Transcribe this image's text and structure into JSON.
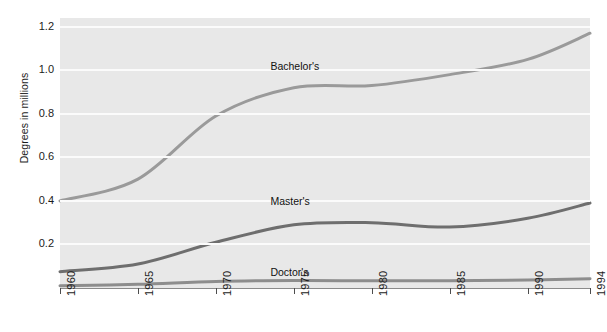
{
  "chart_data": {
    "type": "line",
    "title": "",
    "subtitle": "",
    "xlabel": "",
    "ylabel": "Degrees in millions",
    "x": [
      1960,
      1965,
      1970,
      1975,
      1980,
      1985,
      1990,
      1994
    ],
    "xtick_labels": [
      "1960",
      "1965",
      "1970",
      "1975",
      "1980",
      "1985",
      "1990",
      "1994"
    ],
    "ytick_labels": [
      "0.2",
      "0.4",
      "0.6",
      "0.8",
      "1.0",
      "1.2"
    ],
    "ytick_values": [
      0.2,
      0.4,
      0.6,
      0.8,
      1.0,
      1.2
    ],
    "xlim": [
      1960,
      1994
    ],
    "ylim": [
      0.0,
      1.24
    ],
    "grid": "horizontal-white-gridlines",
    "legend": "inline-labels-on-series",
    "plot_background": "#e8e8e8",
    "figure_background": "#ffffff",
    "series": [
      {
        "name": "Bachelor's",
        "label": "Bachelor's",
        "color": "#9a9a9a",
        "line_width": 3,
        "label_x": 1973.5,
        "label_y": 1.02,
        "values": [
          0.4,
          0.5,
          0.79,
          0.92,
          0.93,
          0.98,
          1.05,
          1.17
        ]
      },
      {
        "name": "Master's",
        "label": "Master's",
        "color": "#6e6e6e",
        "line_width": 3,
        "label_x": 1973.5,
        "label_y": 0.4,
        "values": [
          0.075,
          0.11,
          0.21,
          0.29,
          0.3,
          0.28,
          0.32,
          0.39
        ]
      },
      {
        "name": "Doctor's",
        "label": "Doctor's",
        "color": "#8d8d8d",
        "line_width": 3,
        "label_x": 1973.5,
        "label_y": 0.075,
        "values": [
          0.01,
          0.017,
          0.03,
          0.034,
          0.033,
          0.033,
          0.037,
          0.043
        ]
      }
    ]
  }
}
